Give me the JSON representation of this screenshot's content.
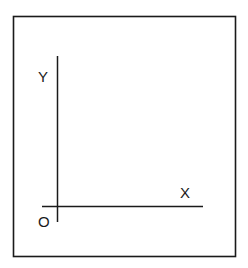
{
  "diagram": {
    "title": "",
    "type": "coordinate-axes",
    "colors": {
      "stroke": "#1a1a1a",
      "background": "#ffffff"
    },
    "frame": {
      "x": 13,
      "y": 16,
      "width": 223,
      "height": 241
    },
    "y_axis": {
      "label": "Y",
      "x": 57,
      "y_start": 56,
      "y_end": 222
    },
    "x_axis": {
      "label": "X",
      "y": 206,
      "x_start": 42,
      "x_end": 203
    },
    "origin": {
      "label": "O"
    }
  }
}
